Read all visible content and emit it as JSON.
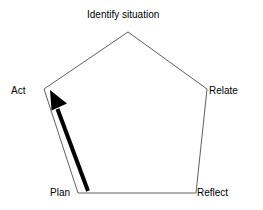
{
  "diagram": {
    "type": "pentagon-cycle-diagram",
    "background_color": "#ffffff",
    "outline_color": "#595959",
    "arrow_color": "#000000",
    "nodes": [
      {
        "id": "identify-situation",
        "label": "Identify situation",
        "vertex_x": 128,
        "vertex_y": 32
      },
      {
        "id": "relate",
        "label": "Relate",
        "vertex_x": 207,
        "vertex_y": 89
      },
      {
        "id": "reflect",
        "label": "Reflect",
        "vertex_x": 196,
        "vertex_y": 193
      },
      {
        "id": "plan",
        "label": "Plan",
        "vertex_x": 78,
        "vertex_y": 193
      },
      {
        "id": "act",
        "label": "Act",
        "vertex_x": 44,
        "vertex_y": 89
      }
    ],
    "arrow": {
      "from_node": "plan",
      "to_node": "act",
      "tail_x": 88,
      "tail_y": 191,
      "tip_x": 50,
      "tip_y": 90,
      "stroke_width": 4
    }
  }
}
